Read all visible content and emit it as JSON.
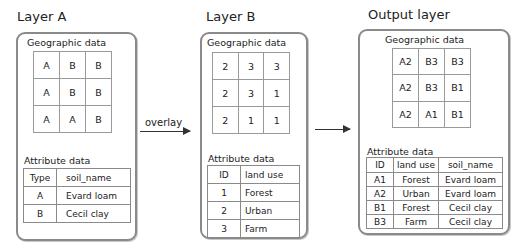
{
  "layers": {
    "a": {
      "title": "Layer A",
      "geo_label": "Geographic data",
      "grid": [
        [
          "A",
          "B",
          "B"
        ],
        [
          "A",
          "B",
          "B"
        ],
        [
          "A",
          "A",
          "B"
        ]
      ],
      "attr_label": "Attribute data",
      "attr_headers": [
        "Type",
        "soil_name"
      ],
      "attr_rows": [
        [
          "A",
          "Evard loam"
        ],
        [
          "B",
          "Cecil clay"
        ]
      ]
    },
    "b": {
      "title": "Layer B",
      "geo_label": "Geographic data",
      "grid": [
        [
          "2",
          "3",
          "3"
        ],
        [
          "2",
          "3",
          "1"
        ],
        [
          "2",
          "1",
          "1"
        ]
      ],
      "attr_label": "Attribute data",
      "attr_headers": [
        "ID",
        "land use"
      ],
      "attr_rows": [
        [
          "1",
          "Forest"
        ],
        [
          "2",
          "Urban"
        ],
        [
          "3",
          "Farm"
        ]
      ]
    },
    "output": {
      "title": "Output layer",
      "geo_label": "Geographic data",
      "grid": [
        [
          "A2",
          "B3",
          "B3"
        ],
        [
          "A2",
          "B3",
          "B1"
        ],
        [
          "A2",
          "A1",
          "B1"
        ]
      ],
      "attr_label": "Attribute data",
      "attr_headers": [
        "ID",
        "land use",
        "soil_name"
      ],
      "attr_rows": [
        [
          "A1",
          "Forest",
          "Evard loam"
        ],
        [
          "A2",
          "Urban",
          "Evard loam"
        ],
        [
          "B1",
          "Forest",
          "Cecil clay"
        ],
        [
          "B3",
          "Farm",
          "Cecil clay"
        ]
      ]
    }
  },
  "arrows": {
    "overlay_label": "overlay"
  },
  "colors": {
    "panel_border": "#8a8a8a",
    "grid_line": "#9a9a9a",
    "arrow": "#333333"
  }
}
